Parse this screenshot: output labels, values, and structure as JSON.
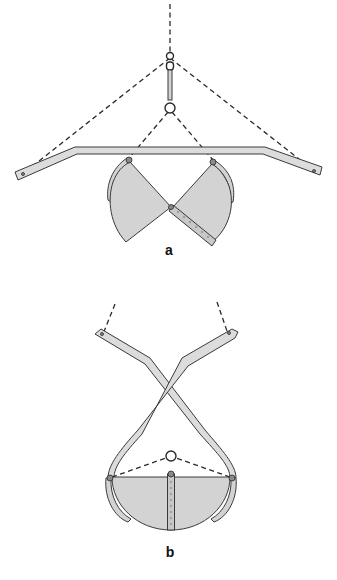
{
  "figure": {
    "panels": [
      {
        "id": "a",
        "label": "a",
        "state": "open",
        "components": [
          "lifting-hook",
          "swivel-link",
          "lower-ring",
          "spreader-bar",
          "left-shell",
          "right-shell",
          "hinge-strip",
          "dashed-ropes"
        ]
      },
      {
        "id": "b",
        "label": "b",
        "state": "closed",
        "components": [
          "crossed-arms",
          "center-ring",
          "closed-bucket",
          "hinge-strip",
          "dashed-ropes"
        ]
      }
    ],
    "colors": {
      "metal_fill": "#d3d3d3",
      "outline": "#3a3a3a",
      "rope": "#2a2a2a",
      "background": "#ffffff"
    }
  }
}
